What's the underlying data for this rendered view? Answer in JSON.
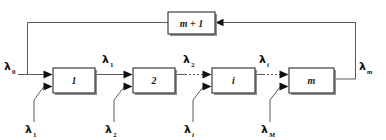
{
  "diagram": {
    "nodes": [
      {
        "id": "stage-1",
        "label": "1",
        "x": 53,
        "y": 68,
        "w": 42,
        "h": 25
      },
      {
        "id": "stage-2",
        "label": "2",
        "x": 133,
        "y": 68,
        "w": 42,
        "h": 25
      },
      {
        "id": "stage-i",
        "label": "i",
        "x": 212,
        "y": 68,
        "w": 43,
        "h": 25
      },
      {
        "id": "stage-m",
        "label": "m",
        "x": 289,
        "y": 68,
        "w": 45,
        "h": 25
      },
      {
        "id": "stage-m-plus-1",
        "label": "m + 1",
        "x": 168,
        "y": 12,
        "w": 47,
        "h": 22
      }
    ],
    "flow_labels": {
      "input_source": {
        "base": "λ",
        "sub": "0",
        "sub_italic": false
      },
      "stage1_out": {
        "base": "λ",
        "sub": "1",
        "sub_italic": false
      },
      "stage2_out": {
        "base": "λ",
        "sub": "2",
        "sub_italic": false
      },
      "stagei_out": {
        "base": "λ",
        "sub": "i",
        "sub_italic": true
      },
      "stagem_out": {
        "base": "λ",
        "sub": "m",
        "sub_italic": true
      },
      "arrival_1": {
        "base": "λ",
        "sub": "1",
        "sub_italic": false
      },
      "arrival_2": {
        "base": "λ",
        "sub": "2",
        "sub_italic": false
      },
      "arrival_i": {
        "base": "λ",
        "sub": "i",
        "sub_italic": true
      },
      "arrival_M": {
        "base": "λ",
        "sub": "M",
        "sub_italic": true
      }
    },
    "colors": {
      "wire": "#555a5e",
      "box_stroke": "#3a3f43",
      "box_fill": "#ffffff",
      "text": "#111111",
      "background": "#ffffff"
    }
  }
}
